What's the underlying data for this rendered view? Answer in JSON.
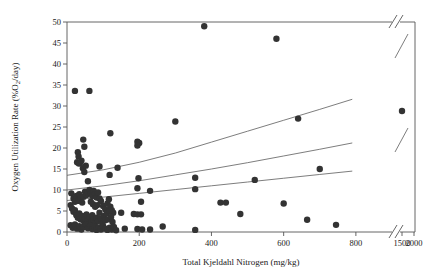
{
  "chart_data": {
    "type": "scatter",
    "title": "",
    "xlabel": "Total Kjeldahl Nitrogen (mg/kg)",
    "ylabel_main": "Oxygen Utilization Rate (%O",
    "ylabel_sub": "2",
    "ylabel_tail": "/day)",
    "ylabel": "Oxygen Utilization Rate (%O2/day)",
    "xlim": [
      0,
      900
    ],
    "ylim": [
      0,
      50
    ],
    "grid": false,
    "legend": false,
    "axis_break": {
      "present": true,
      "axis": "x",
      "after_value": 900,
      "resumed_ticks": [
        1500,
        2000
      ]
    },
    "xticks": [
      0,
      200,
      400,
      600,
      800
    ],
    "xticks_after_break": [
      1500,
      2000
    ],
    "yticks": [
      0,
      5,
      10,
      15,
      20,
      25,
      30,
      35,
      40,
      45,
      50
    ],
    "marker": {
      "shape": "circle",
      "color": "#333333",
      "size": 4.2
    },
    "points": [
      [
        22,
        33.6
      ],
      [
        62,
        33.6
      ],
      [
        380,
        49.0
      ],
      [
        580,
        46.0
      ],
      [
        300,
        26.3
      ],
      [
        640,
        27.0
      ],
      [
        1500,
        28.8
      ],
      [
        120,
        23.5
      ],
      [
        195,
        21.5
      ],
      [
        200,
        21.2
      ],
      [
        195,
        20.6
      ],
      [
        45,
        22.0
      ],
      [
        48,
        20.3
      ],
      [
        30,
        19.0
      ],
      [
        32,
        18.0
      ],
      [
        28,
        16.6
      ],
      [
        33,
        16.3
      ],
      [
        36,
        16.4
      ],
      [
        40,
        17.0
      ],
      [
        44,
        15.2
      ],
      [
        48,
        14.3
      ],
      [
        52,
        15.8
      ],
      [
        90,
        15.6
      ],
      [
        118,
        13.6
      ],
      [
        140,
        15.3
      ],
      [
        58,
        12.1
      ],
      [
        198,
        12.8
      ],
      [
        355,
        12.9
      ],
      [
        520,
        12.4
      ],
      [
        700,
        15.0
      ],
      [
        195,
        10.4
      ],
      [
        230,
        9.8
      ],
      [
        355,
        10.2
      ],
      [
        425,
        7.0
      ],
      [
        440,
        7.0
      ],
      [
        12,
        9.2
      ],
      [
        18,
        8.0
      ],
      [
        22,
        7.2
      ],
      [
        26,
        8.6
      ],
      [
        30,
        7.4
      ],
      [
        34,
        9.0
      ],
      [
        38,
        8.2
      ],
      [
        42,
        7.0
      ],
      [
        46,
        8.4
      ],
      [
        50,
        9.6
      ],
      [
        54,
        8.8
      ],
      [
        58,
        9.4
      ],
      [
        62,
        10.0
      ],
      [
        66,
        9.2
      ],
      [
        70,
        8.6
      ],
      [
        74,
        9.8
      ],
      [
        78,
        9.0
      ],
      [
        82,
        8.2
      ],
      [
        86,
        9.4
      ],
      [
        90,
        8.0
      ],
      [
        94,
        7.4
      ],
      [
        66,
        7.2
      ],
      [
        72,
        6.6
      ],
      [
        78,
        6.0
      ],
      [
        84,
        6.4
      ],
      [
        100,
        6.2
      ],
      [
        106,
        5.4
      ],
      [
        112,
        6.8
      ],
      [
        116,
        7.8
      ],
      [
        120,
        6.0
      ],
      [
        124,
        5.2
      ],
      [
        128,
        4.6
      ],
      [
        10,
        6.4
      ],
      [
        14,
        5.6
      ],
      [
        18,
        4.8
      ],
      [
        22,
        5.2
      ],
      [
        26,
        4.0
      ],
      [
        30,
        3.4
      ],
      [
        34,
        4.4
      ],
      [
        38,
        3.0
      ],
      [
        42,
        3.8
      ],
      [
        46,
        2.6
      ],
      [
        50,
        3.2
      ],
      [
        54,
        4.2
      ],
      [
        58,
        2.8
      ],
      [
        62,
        3.6
      ],
      [
        66,
        2.4
      ],
      [
        70,
        4.0
      ],
      [
        74,
        3.0
      ],
      [
        78,
        2.2
      ],
      [
        82,
        3.4
      ],
      [
        86,
        2.6
      ],
      [
        90,
        4.6
      ],
      [
        94,
        3.2
      ],
      [
        98,
        2.0
      ],
      [
        102,
        3.8
      ],
      [
        106,
        2.8
      ],
      [
        110,
        4.4
      ],
      [
        114,
        3.0
      ],
      [
        118,
        5.0
      ],
      [
        122,
        3.6
      ],
      [
        126,
        2.4
      ],
      [
        10,
        1.6
      ],
      [
        16,
        1.0
      ],
      [
        22,
        1.8
      ],
      [
        28,
        0.8
      ],
      [
        34,
        1.4
      ],
      [
        40,
        0.6
      ],
      [
        46,
        1.2
      ],
      [
        52,
        1.8
      ],
      [
        58,
        0.9
      ],
      [
        64,
        1.5
      ],
      [
        70,
        0.7
      ],
      [
        76,
        1.3
      ],
      [
        82,
        0.5
      ],
      [
        88,
        1.1
      ],
      [
        94,
        0.6
      ],
      [
        100,
        1.4
      ],
      [
        106,
        0.8
      ],
      [
        112,
        0.5
      ],
      [
        118,
        1.0
      ],
      [
        124,
        0.6
      ],
      [
        130,
        1.2
      ],
      [
        136,
        0.4
      ],
      [
        150,
        4.6
      ],
      [
        185,
        4.3
      ],
      [
        195,
        4.2
      ],
      [
        205,
        4.2
      ],
      [
        160,
        0.8
      ],
      [
        195,
        0.7
      ],
      [
        208,
        0.6
      ],
      [
        265,
        1.3
      ],
      [
        355,
        0.5
      ],
      [
        480,
        4.3
      ],
      [
        600,
        6.8
      ],
      [
        665,
        2.9
      ],
      [
        745,
        1.7
      ],
      [
        205,
        7.2
      ],
      [
        230,
        0.6
      ]
    ],
    "trend_lines": [
      {
        "name": "upper-curve",
        "points": [
          [
            0,
            13.5
          ],
          [
            100,
            14.8
          ],
          [
            200,
            16.6
          ],
          [
            300,
            18.8
          ],
          [
            400,
            21.4
          ],
          [
            500,
            24.0
          ],
          [
            600,
            26.6
          ],
          [
            700,
            29.2
          ],
          [
            790,
            31.6
          ]
        ]
      },
      {
        "name": "middle-curve",
        "points": [
          [
            0,
            10.0
          ],
          [
            100,
            11.0
          ],
          [
            200,
            12.2
          ],
          [
            300,
            13.6
          ],
          [
            400,
            15.0
          ],
          [
            500,
            16.5
          ],
          [
            600,
            18.1
          ],
          [
            700,
            19.7
          ],
          [
            790,
            21.2
          ]
        ]
      },
      {
        "name": "lower-curve",
        "points": [
          [
            0,
            7.5
          ],
          [
            100,
            8.3
          ],
          [
            200,
            9.2
          ],
          [
            300,
            10.1
          ],
          [
            400,
            11.0
          ],
          [
            500,
            11.9
          ],
          [
            600,
            12.8
          ],
          [
            700,
            13.7
          ],
          [
            790,
            14.5
          ]
        ]
      }
    ],
    "trend_lines_after_break": [
      {
        "name": "upper-curve-right",
        "points": [
          [
            1300,
            33.0
          ],
          [
            2000,
            38.0
          ]
        ]
      },
      {
        "name": "middle-curve-right",
        "points": [
          [
            1300,
            21.5
          ],
          [
            2000,
            24.5
          ]
        ]
      }
    ]
  }
}
